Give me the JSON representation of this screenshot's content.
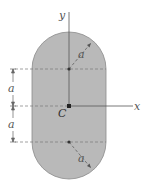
{
  "diagram": {
    "colors": {
      "fill": "#b9b9b9",
      "outline": "#8a8a8a",
      "axis": "#555555",
      "dashed": "#7a7a7a",
      "background": "#ffffff"
    },
    "axes": {
      "y_label": "y",
      "x_label": "x"
    },
    "centroid": {
      "label": "C"
    },
    "dimensions": {
      "upper_spacing_label": "a",
      "lower_spacing_label": "a",
      "upper_radius_label": "a",
      "lower_radius_label": "a"
    }
  }
}
